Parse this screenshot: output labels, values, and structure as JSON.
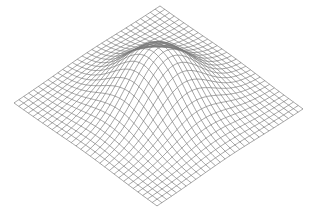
{
  "figure": {
    "type": "3d-wireframe-surface",
    "width": 313,
    "height": 213,
    "background": "#ffffff",
    "line_color": "#7a7a7a",
    "line_width": 0.7
  },
  "surface": {
    "grid_divisions": 30,
    "corners": {
      "top": [
        160,
        6
      ],
      "left": [
        14,
        103
      ],
      "right": [
        303,
        109
      ]
    },
    "peak": {
      "center_u": 0.5,
      "center_v": 0.5,
      "height_px": 58,
      "sigma": 0.19
    }
  }
}
